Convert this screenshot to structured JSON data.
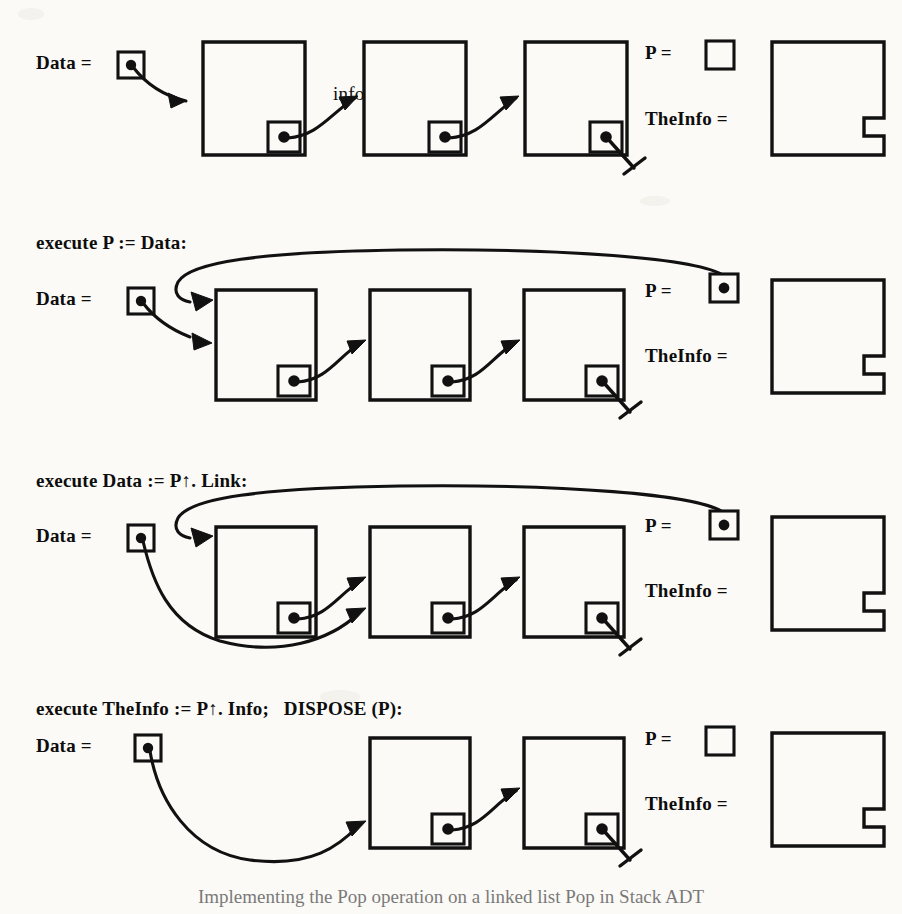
{
  "figure": {
    "caption": "Implementing the Pop operation on a linked list Pop in Stack ADT",
    "background_color": "#fbfaf7",
    "ink_color": "#111111",
    "node_label_nil": "nil"
  },
  "labels": {
    "data": "Data =",
    "p": "P =",
    "theinfo": "TheInfo =",
    "unknown_value": "?????"
  },
  "rows": [
    {
      "id": "row-initial",
      "step_text": "",
      "nodes": [
        "info1",
        "info2",
        "info3"
      ],
      "data_points_to": "info1",
      "p_value": "nil",
      "theinfo_value": "?????"
    },
    {
      "id": "row-assign-p",
      "step_text": "execute P := Data:",
      "nodes": [
        "info1",
        "info2",
        "info3"
      ],
      "data_points_to": "info1",
      "p_value": "info1",
      "theinfo_value": "?????"
    },
    {
      "id": "row-advance-data",
      "step_text": "execute Data := P↑. Link:",
      "nodes": [
        "info1",
        "info2",
        "info3"
      ],
      "data_points_to": "info2",
      "p_value": "info1",
      "theinfo_value": "?????"
    },
    {
      "id": "row-dispose",
      "step_text": "execute TheInfo := P↑. Info;   DISPOSE (P):",
      "nodes": [
        "info2",
        "info3"
      ],
      "data_points_to": "info2",
      "p_value": "nil",
      "theinfo_value": "info1"
    }
  ]
}
